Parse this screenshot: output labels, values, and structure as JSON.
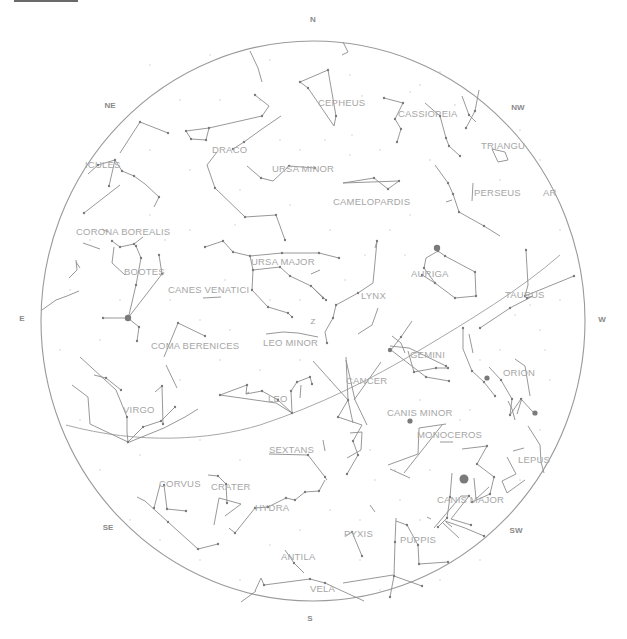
{
  "colors": {
    "background": "#ffffff",
    "horizon": "#9a9a9a",
    "lines": "#8c8c8c",
    "labels": "#a6a6a6",
    "directions": "#8a8a8a"
  },
  "horizon": {
    "cx": 313,
    "cy": 321,
    "rx": 272,
    "ry": 280
  },
  "directions": [
    {
      "label": "N",
      "x": 313,
      "y": 22
    },
    {
      "label": "NE",
      "x": 110,
      "y": 108
    },
    {
      "label": "NW",
      "x": 518,
      "y": 110
    },
    {
      "label": "E",
      "x": 22,
      "y": 321
    },
    {
      "label": "W",
      "x": 602,
      "y": 322
    },
    {
      "label": "SE",
      "x": 108,
      "y": 530
    },
    {
      "label": "SW",
      "x": 516,
      "y": 533
    },
    {
      "label": "S",
      "x": 310,
      "y": 621
    }
  ],
  "zenith": {
    "label": "Z",
    "x": 313,
    "y": 324
  },
  "constellations": [
    {
      "name": "CEPHEUS",
      "x": 318,
      "y": 106
    },
    {
      "name": "CASSIOPEIA",
      "x": 398,
      "y": 117
    },
    {
      "name": "TRIANGULUM",
      "label": "TRIANGU",
      "x": 481,
      "y": 149
    },
    {
      "name": "HERCULES",
      "label": "ICULES",
      "x": 85,
      "y": 168
    },
    {
      "name": "DRACO",
      "x": 212,
      "y": 153
    },
    {
      "name": "URSA MINOR",
      "x": 272,
      "y": 172
    },
    {
      "name": "PERSEUS",
      "x": 474,
      "y": 196
    },
    {
      "name": "CAMELOPARDIS",
      "x": 333,
      "y": 205
    },
    {
      "name": "ARIES",
      "label": "AR",
      "x": 543,
      "y": 196
    },
    {
      "name": "CORONA BOREALIS",
      "x": 76,
      "y": 235
    },
    {
      "name": "URSA MAJOR",
      "x": 251,
      "y": 265
    },
    {
      "name": "AURIGA",
      "x": 411,
      "y": 277
    },
    {
      "name": "BOOTES",
      "x": 124,
      "y": 275
    },
    {
      "name": "CANES VENATICI",
      "x": 168,
      "y": 293
    },
    {
      "name": "LYNX",
      "x": 361,
      "y": 299
    },
    {
      "name": "TAURUS",
      "x": 505,
      "y": 298
    },
    {
      "name": "COMA BERENICES",
      "x": 151,
      "y": 349
    },
    {
      "name": "LEO MINOR",
      "x": 263,
      "y": 346
    },
    {
      "name": "GEMINI",
      "x": 410,
      "y": 358
    },
    {
      "name": "ORION",
      "x": 503,
      "y": 376
    },
    {
      "name": "CANCER",
      "x": 346,
      "y": 384
    },
    {
      "name": "LEO",
      "x": 268,
      "y": 402
    },
    {
      "name": "VIRGO",
      "x": 123,
      "y": 413
    },
    {
      "name": "CANIS MINOR",
      "x": 387,
      "y": 416
    },
    {
      "name": "MONOCEROS",
      "x": 417,
      "y": 438
    },
    {
      "name": "SEXTANS",
      "x": 269,
      "y": 453
    },
    {
      "name": "LEPUS",
      "x": 518,
      "y": 463
    },
    {
      "name": "CORVUS",
      "x": 159,
      "y": 487
    },
    {
      "name": "CRATER",
      "x": 211,
      "y": 490
    },
    {
      "name": "CANIS MAJOR",
      "x": 437,
      "y": 503
    },
    {
      "name": "HYDRA",
      "x": 255,
      "y": 511
    },
    {
      "name": "PYXIS",
      "x": 344,
      "y": 537
    },
    {
      "name": "PUPPIS",
      "x": 400,
      "y": 543
    },
    {
      "name": "ANTILA",
      "x": 281,
      "y": 560
    },
    {
      "name": "VELA",
      "x": 310,
      "y": 592
    }
  ],
  "lines": [
    "M250,51 L258,68 L262,82",
    "M343,42 L348,52 L342,55",
    "M300,82 L328,70 L336,116 L334,126 L308,88 Z",
    "M384,98 L403,103 L395,119 L401,129 L397,142",
    "M425,103 L440,116 L446,138 L449,146 L460,156",
    "M462,96 L469,115 L476,122",
    "M479,90 L475,111 L466,128",
    "M492,149 L505,152 L508,160 L498,162 Z",
    "M120,153 L140,122 L168,133",
    "M88,174 L98,165 L115,160 L122,171 L134,176",
    "M115,160 L109,186",
    "M134,176 L145,184 L159,197 L154,207",
    "M120,185 L84,213",
    "M186,131 L209,128 L206,140 L191,139 Z",
    "M209,128 L262,116 L269,106 L255,95",
    "M281,116 L262,129 L244,142 L233,149",
    "M217,152 L207,165 L215,188 L245,217 L276,215 L285,240",
    "M247,166 L261,178 L273,181 L289,166 L315,168",
    "M343,183 L374,178 L388,189 L399,181 Z",
    "M435,165 L448,183 L453,194 L459,212 L484,226 L500,236",
    "M473,183 L472,201",
    "M446,202 L452,200",
    "M102,229 L108,232",
    "M112,241 L120,247 L134,244 L143,237",
    "M114,247 L112,263 L125,275",
    "M76,260 L77,270 L69,278",
    "M76,262 L80,268",
    "M83,243 L100,249",
    "M79,291 L67,296 L56,300 L42,310",
    "M136,246 L141,258 L136,285 L129,315",
    "M159,255 L162,274 L128,318",
    "M103,318 L128,318 L139,327 L137,341",
    "M205,247 L223,241 L233,252 L250,256 L282,253 L319,253 L339,258",
    "M250,256 L253,270 L280,267 L290,276 L311,286 L323,298",
    "M311,286 L326,300",
    "M253,270 L252,290 L268,307 L288,313 L292,317",
    "M320,270 L311,274",
    "M203,298 L221,297",
    "M164,357 L178,323 L205,336",
    "M266,334 L283,332 L298,333 L318,337",
    "M375,248 L377,241 L373,283 L358,293 L336,305 L333,318 L325,332 L327,343",
    "M426,258 L438,251 L445,256 L475,272 L476,296 L455,298 L435,283 L424,268 Z",
    "M435,283 L422,275",
    "M526,250 L528,285 L525,296 L574,276",
    "M527,298 L533,296 L510,308 L480,328",
    "M378,308 L372,325 L358,334",
    "M392,336 L401,343 L405,353",
    "M412,321 L401,337 L391,350 L426,377 L449,381",
    "M390,346 L409,348 L446,366",
    "M408,351 L414,372 L436,368 L448,368",
    "M463,328 L463,349 L472,371 L484,382 L495,396",
    "M469,334 L473,353",
    "M489,367 L501,380 L512,399 L510,415 L521,399 L533,412",
    "M515,359 L525,366 L530,396",
    "M508,401 L512,409 L515,420",
    "M522,398 L517,414",
    "M346,357 L348,400 L338,417 L362,425 L353,441 L358,455 L347,474",
    "M313,361 L348,400 L353,423",
    "M346,360 L355,400 L367,425",
    "M381,362 L354,400",
    "M220,395 L247,385 L246,394 L262,391 L278,400 L292,413",
    "M246,394 L249,392",
    "M220,395 L276,403 L292,413 L291,391 L297,382 L310,377 L312,384",
    "M301,385 L300,398",
    "M94,375 L106,378 L121,390",
    "M80,357 L116,390 L127,417 L127,432 L128,442",
    "M72,385 L88,397 L90,424 L128,442 L143,427 L161,421 L175,407",
    "M155,392 L162,386",
    "M127,443 L164,428 L185,417 L198,409",
    "M162,386 L163,424",
    "M166,365 L177,388",
    "M388,465 L418,454 L419,428 L446,424",
    "M390,469 L410,478",
    "M440,442 L453,442",
    "M404,473 L442,425",
    "M323,440 L325,451",
    "M269,454 L308,455 L325,477 L327,480",
    "M350,433 L362,432 L361,450 L347,458",
    "M325,480 L319,491 L305,492 L295,500 L286,498 L268,507 L255,508 L235,533 L229,528",
    "M225,516 L241,504 L219,498 L214,525",
    "M208,475 L218,476 L226,484 L227,503",
    "M164,485 L167,509 L186,511",
    "M160,485 L154,508",
    "M137,497 L145,501 L168,522 L198,549 L218,544",
    "M462,449 L487,446 L477,464 L494,477 L490,494 L472,502",
    "M528,426 L540,445 L541,462 L544,473",
    "M513,451 L524,448",
    "M507,457 L516,474 L502,481 L507,493 L525,480",
    "M474,478 L476,499 L489,487",
    "M452,473 L450,497 L447,518 L438,527",
    "M434,528 L461,496 L469,496 L451,519 L471,525",
    "M446,522 L452,527",
    "M445,521 L465,528 L484,536",
    "M431,519 L427,517",
    "M443,523 L459,538",
    "M396,518 L395,542 L394,576 L390,597",
    "M396,521 L407,525 L418,545 L419,564 L448,562",
    "M394,576 L422,586",
    "M346,536 L352,532 L362,556",
    "M370,505 L375,512",
    "M285,550 L294,563 L304,573",
    "M255,591 L261,578 L264,585 L310,579 L325,583 L364,601",
    "M241,602 L256,591",
    "M343,583 L393,575"
  ],
  "ecliptic": "M66,425 C140,445 210,440 260,425 C320,405 370,380 420,350 C470,320 520,290 560,255",
  "bright_stars": [
    {
      "x": 128,
      "y": 318,
      "r": 3.2
    },
    {
      "x": 437,
      "y": 248,
      "r": 3.2
    },
    {
      "x": 464,
      "y": 479,
      "r": 4.5
    },
    {
      "x": 410,
      "y": 421,
      "r": 2.6
    },
    {
      "x": 487,
      "y": 378,
      "r": 2.6
    },
    {
      "x": 535,
      "y": 413,
      "r": 2.6
    },
    {
      "x": 390,
      "y": 350,
      "r": 2.2
    }
  ],
  "stars": [
    [
      300,
      82
    ],
    [
      328,
      70
    ],
    [
      336,
      116
    ],
    [
      308,
      88
    ],
    [
      384,
      98
    ],
    [
      403,
      103
    ],
    [
      395,
      119
    ],
    [
      401,
      129
    ],
    [
      397,
      142
    ],
    [
      440,
      116
    ],
    [
      446,
      138
    ],
    [
      449,
      146
    ],
    [
      460,
      156
    ],
    [
      466,
      128
    ],
    [
      475,
      111
    ],
    [
      469,
      115
    ],
    [
      140,
      122
    ],
    [
      168,
      133
    ],
    [
      98,
      165
    ],
    [
      115,
      160
    ],
    [
      122,
      171
    ],
    [
      134,
      176
    ],
    [
      159,
      197
    ],
    [
      109,
      186
    ],
    [
      84,
      213
    ],
    [
      186,
      131
    ],
    [
      209,
      128
    ],
    [
      206,
      140
    ],
    [
      191,
      139
    ],
    [
      262,
      116
    ],
    [
      255,
      95
    ],
    [
      233,
      149
    ],
    [
      244,
      142
    ],
    [
      215,
      188
    ],
    [
      245,
      217
    ],
    [
      276,
      215
    ],
    [
      285,
      240
    ],
    [
      261,
      178
    ],
    [
      289,
      166
    ],
    [
      315,
      168
    ],
    [
      374,
      178
    ],
    [
      388,
      189
    ],
    [
      399,
      181
    ],
    [
      448,
      183
    ],
    [
      453,
      194
    ],
    [
      459,
      212
    ],
    [
      484,
      226
    ],
    [
      112,
      241
    ],
    [
      120,
      247
    ],
    [
      134,
      244
    ],
    [
      136,
      246
    ],
    [
      141,
      258
    ],
    [
      136,
      285
    ],
    [
      159,
      255
    ],
    [
      162,
      274
    ],
    [
      103,
      318
    ],
    [
      139,
      327
    ],
    [
      137,
      341
    ],
    [
      178,
      323
    ],
    [
      205,
      336
    ],
    [
      205,
      247
    ],
    [
      223,
      241
    ],
    [
      233,
      252
    ],
    [
      250,
      256
    ],
    [
      282,
      253
    ],
    [
      319,
      253
    ],
    [
      339,
      258
    ],
    [
      253,
      270
    ],
    [
      280,
      267
    ],
    [
      290,
      276
    ],
    [
      311,
      286
    ],
    [
      323,
      298
    ],
    [
      326,
      300
    ],
    [
      252,
      290
    ],
    [
      268,
      307
    ],
    [
      288,
      313
    ],
    [
      292,
      317
    ],
    [
      358,
      293
    ],
    [
      336,
      305
    ],
    [
      333,
      318
    ],
    [
      327,
      343
    ],
    [
      377,
      241
    ],
    [
      438,
      251
    ],
    [
      445,
      256
    ],
    [
      475,
      272
    ],
    [
      476,
      296
    ],
    [
      455,
      298
    ],
    [
      435,
      283
    ],
    [
      424,
      268
    ],
    [
      422,
      275
    ],
    [
      526,
      250
    ],
    [
      525,
      296
    ],
    [
      527,
      298
    ],
    [
      510,
      308
    ],
    [
      480,
      328
    ],
    [
      574,
      276
    ],
    [
      401,
      337
    ],
    [
      426,
      377
    ],
    [
      449,
      381
    ],
    [
      446,
      366
    ],
    [
      414,
      372
    ],
    [
      436,
      368
    ],
    [
      448,
      368
    ],
    [
      463,
      328
    ],
    [
      472,
      371
    ],
    [
      484,
      382
    ],
    [
      495,
      396
    ],
    [
      501,
      380
    ],
    [
      512,
      399
    ],
    [
      510,
      415
    ],
    [
      521,
      399
    ],
    [
      348,
      400
    ],
    [
      338,
      417
    ],
    [
      353,
      441
    ],
    [
      358,
      455
    ],
    [
      347,
      474
    ],
    [
      220,
      395
    ],
    [
      247,
      385
    ],
    [
      262,
      391
    ],
    [
      278,
      400
    ],
    [
      292,
      413
    ],
    [
      291,
      391
    ],
    [
      297,
      382
    ],
    [
      310,
      377
    ],
    [
      312,
      384
    ],
    [
      106,
      378
    ],
    [
      121,
      390
    ],
    [
      127,
      417
    ],
    [
      128,
      442
    ],
    [
      143,
      427
    ],
    [
      161,
      421
    ],
    [
      175,
      407
    ],
    [
      162,
      386
    ],
    [
      163,
      424
    ],
    [
      308,
      455
    ],
    [
      325,
      477
    ],
    [
      319,
      491
    ],
    [
      305,
      492
    ],
    [
      295,
      500
    ],
    [
      286,
      498
    ],
    [
      268,
      507
    ],
    [
      255,
      508
    ],
    [
      235,
      533
    ],
    [
      218,
      476
    ],
    [
      226,
      484
    ],
    [
      227,
      503
    ],
    [
      164,
      485
    ],
    [
      167,
      509
    ],
    [
      186,
      511
    ],
    [
      154,
      508
    ],
    [
      168,
      522
    ],
    [
      198,
      549
    ],
    [
      218,
      544
    ],
    [
      487,
      446
    ],
    [
      477,
      464
    ],
    [
      494,
      477
    ],
    [
      490,
      494
    ],
    [
      472,
      502
    ],
    [
      450,
      497
    ],
    [
      447,
      518
    ],
    [
      438,
      527
    ],
    [
      469,
      496
    ],
    [
      471,
      525
    ],
    [
      484,
      536
    ],
    [
      395,
      542
    ],
    [
      394,
      576
    ],
    [
      390,
      597
    ],
    [
      407,
      525
    ],
    [
      418,
      545
    ],
    [
      419,
      564
    ],
    [
      448,
      562
    ],
    [
      422,
      586
    ],
    [
      352,
      532
    ],
    [
      362,
      556
    ],
    [
      294,
      563
    ],
    [
      264,
      585
    ],
    [
      310,
      579
    ],
    [
      325,
      583
    ]
  ],
  "faint_stars": [
    [
      150,
      65
    ],
    [
      210,
      55
    ],
    [
      270,
      60
    ],
    [
      300,
      150
    ],
    [
      350,
      75
    ],
    [
      380,
      150
    ],
    [
      420,
      85
    ],
    [
      430,
      160
    ],
    [
      455,
      105
    ],
    [
      520,
      130
    ],
    [
      540,
      160
    ],
    [
      555,
      190
    ],
    [
      560,
      230
    ],
    [
      500,
      180
    ],
    [
      410,
      215
    ],
    [
      330,
      230
    ],
    [
      290,
      205
    ],
    [
      240,
      190
    ],
    [
      190,
      170
    ],
    [
      150,
      215
    ],
    [
      90,
      240
    ],
    [
      70,
      290
    ],
    [
      60,
      350
    ],
    [
      80,
      420
    ],
    [
      100,
      470
    ],
    [
      140,
      455
    ],
    [
      200,
      440
    ],
    [
      240,
      460
    ],
    [
      180,
      380
    ],
    [
      220,
      360
    ],
    [
      260,
      370
    ],
    [
      300,
      360
    ],
    [
      330,
      380
    ],
    [
      370,
      450
    ],
    [
      400,
      500
    ],
    [
      430,
      470
    ],
    [
      420,
      400
    ],
    [
      460,
      420
    ],
    [
      500,
      350
    ],
    [
      540,
      330
    ],
    [
      560,
      300
    ],
    [
      550,
      380
    ],
    [
      540,
      430
    ],
    [
      520,
      480
    ],
    [
      480,
      560
    ],
    [
      440,
      580
    ],
    [
      360,
      520
    ],
    [
      330,
      510
    ],
    [
      300,
      530
    ],
    [
      270,
      545
    ],
    [
      240,
      580
    ],
    [
      200,
      560
    ],
    [
      160,
      540
    ],
    [
      130,
      520
    ],
    [
      230,
      330
    ],
    [
      200,
      320
    ],
    [
      170,
      300
    ],
    [
      120,
      300
    ],
    [
      100,
      340
    ],
    [
      360,
      560
    ],
    [
      380,
      590
    ],
    [
      420,
      520
    ],
    [
      395,
      470
    ],
    [
      375,
      480
    ],
    [
      470,
      410
    ],
    [
      480,
      360
    ],
    [
      515,
      315
    ],
    [
      530,
      305
    ],
    [
      545,
      350
    ],
    [
      390,
      230
    ],
    [
      405,
      255
    ],
    [
      365,
      255
    ],
    [
      345,
      280
    ],
    [
      300,
      300
    ],
    [
      270,
      300
    ],
    [
      225,
      280
    ],
    [
      190,
      230
    ],
    [
      165,
      240
    ],
    [
      235,
      225
    ],
    [
      325,
      140
    ],
    [
      352,
      135
    ],
    [
      362,
      96
    ],
    [
      410,
      92
    ],
    [
      440,
      72
    ],
    [
      350,
      155
    ],
    [
      280,
      140
    ],
    [
      260,
      100
    ],
    [
      220,
      100
    ],
    [
      180,
      100
    ],
    [
      150,
      150
    ]
  ],
  "top_bar": {
    "visible": true
  }
}
